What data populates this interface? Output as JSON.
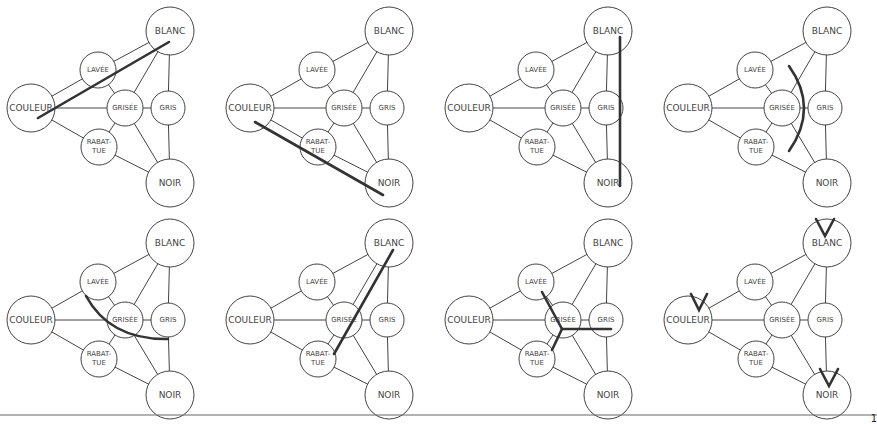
{
  "nodes": [
    {
      "id": "blanc",
      "label": [
        "BLANC"
      ],
      "x": 170,
      "y": 31,
      "r": 24,
      "fs": 9
    },
    {
      "id": "lavee",
      "label": [
        "LAVÉE"
      ],
      "x": 98,
      "y": 70,
      "r": 18,
      "fs": 7
    },
    {
      "id": "couleur",
      "label": [
        "COULEUR"
      ],
      "x": 31,
      "y": 108,
      "r": 24,
      "fs": 9
    },
    {
      "id": "grisee",
      "label": [
        "GRISÉE"
      ],
      "x": 125,
      "y": 108,
      "r": 18,
      "fs": 7
    },
    {
      "id": "gris",
      "label": [
        "GRIS"
      ],
      "x": 168,
      "y": 108,
      "r": 17,
      "fs": 7
    },
    {
      "id": "rabattue",
      "label": [
        "RABAT-",
        "TUE"
      ],
      "x": 99,
      "y": 147,
      "r": 18,
      "fs": 7
    },
    {
      "id": "noir",
      "label": [
        "NOIR"
      ],
      "x": 170,
      "y": 183,
      "r": 24,
      "fs": 9
    }
  ],
  "edges": [
    [
      "couleur",
      "lavee"
    ],
    [
      "lavee",
      "blanc"
    ],
    [
      "couleur",
      "grisee"
    ],
    [
      "grisee",
      "gris"
    ],
    [
      "couleur",
      "rabattue"
    ],
    [
      "rabattue",
      "noir"
    ],
    [
      "blanc",
      "grisee"
    ],
    [
      "grisee",
      "noir"
    ],
    [
      "lavee",
      "grisee"
    ],
    [
      "rabattue",
      "grisee"
    ],
    [
      "blanc",
      "gris"
    ],
    [
      "gris",
      "noir"
    ]
  ],
  "panels": [
    {
      "name": "couleur-blanc",
      "ox": 0,
      "oy": 0,
      "marks": [
        {
          "t": "line",
          "d": [
            38,
            118,
            169,
            42
          ]
        }
      ]
    },
    {
      "name": "couleur-noir",
      "ox": 219,
      "oy": 0,
      "marks": [
        {
          "t": "line",
          "d": [
            36,
            122,
            164,
            195
          ]
        }
      ]
    },
    {
      "name": "blanc-noir",
      "ox": 438,
      "oy": 0,
      "marks": [
        {
          "t": "line",
          "d": [
            182,
            37,
            182,
            186
          ]
        }
      ]
    },
    {
      "name": "lavee-rabattue",
      "ox": 657,
      "oy": 0,
      "marks": [
        {
          "t": "path",
          "d": "M 132 66 Q 162 108 132 151"
        }
      ]
    },
    {
      "name": "lavee-gris",
      "ox": 0,
      "oy": 212,
      "marks": [
        {
          "t": "path",
          "d": "M 86 84 Q 110 128 168 127"
        }
      ]
    },
    {
      "name": "rabattue-blanc",
      "ox": 219,
      "oy": 212,
      "marks": [
        {
          "t": "line",
          "d": [
            174,
            38,
            115,
            142
          ]
        }
      ]
    },
    {
      "name": "grisee-center",
      "ox": 438,
      "oy": 212,
      "marks": [
        {
          "t": "line",
          "d": [
            104,
            80,
            124,
            117
          ]
        },
        {
          "t": "line",
          "d": [
            124,
            117,
            173,
            117
          ]
        },
        {
          "t": "line",
          "d": [
            124,
            117,
            114,
            138
          ]
        }
      ]
    },
    {
      "name": "poles",
      "ox": 657,
      "oy": 212,
      "marks": [
        {
          "t": "path",
          "d": "M 159 7 L 168 24 L 177 7"
        },
        {
          "t": "path",
          "d": "M 34 82 L 42 98 L 50 82"
        },
        {
          "t": "path",
          "d": "M 163 157 L 172 174 L 181 157"
        }
      ]
    }
  ],
  "footer": {
    "page_number": "1",
    "rule_y": 415
  },
  "colors": {
    "stroke": "#444444",
    "mark": "#333333",
    "background": "#ffffff"
  }
}
